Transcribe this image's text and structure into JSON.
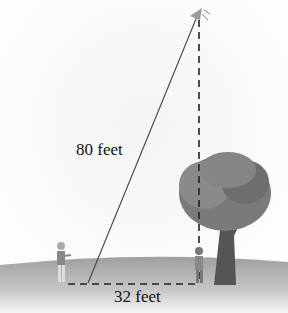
{
  "figure": {
    "hypotenuse_label": "80 feet",
    "base_label": "32 feet",
    "elements": [
      "kite",
      "kite-string",
      "vertical-dashed-height",
      "horizontal-dashed-ground-distance",
      "person-flying-kite",
      "person-under-kite",
      "tree",
      "ground"
    ]
  }
}
